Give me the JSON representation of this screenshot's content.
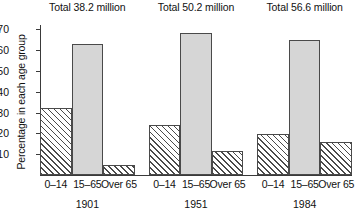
{
  "chart_data": {
    "type": "bar",
    "title": "",
    "xlabel": "",
    "ylabel": "Percentage in each age group",
    "ylim": [
      0,
      72
    ],
    "grid": false,
    "legend": "none",
    "categories": [
      "0–14",
      "15–65",
      "Over 65"
    ],
    "groups": [
      {
        "year": "1901",
        "total_label": "Total 38.2 million",
        "total_millions": 38.2,
        "values": [
          32,
          63,
          5
        ],
        "fills": [
          "hatch",
          "solid",
          "hatch"
        ]
      },
      {
        "year": "1951",
        "total_label": "Total 50.2 million",
        "total_millions": 50.2,
        "values": [
          24,
          68,
          11.5
        ],
        "fills": [
          "hatch",
          "solid",
          "hatch"
        ]
      },
      {
        "year": "1984",
        "total_label": "Total 56.6 million",
        "total_millions": 56.6,
        "values": [
          19.5,
          65,
          16
        ],
        "fills": [
          "hatch",
          "solid",
          "hatch"
        ]
      }
    ],
    "yticks": [
      10,
      20,
      30,
      40,
      50,
      60,
      70
    ],
    "ytick_labels": [
      "10",
      "20",
      "30",
      "40",
      "50",
      "60",
      "70"
    ]
  },
  "colors": {
    "solid_fill": "#d6d6d6",
    "bar_stroke": "#4a4a4a",
    "axis": "#3a3a3a",
    "background": "#ffffff",
    "text": "#111111"
  }
}
